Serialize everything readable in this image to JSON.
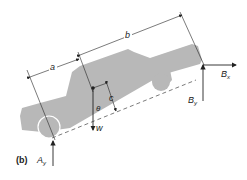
{
  "figure": {
    "label": "(b)"
  },
  "labels": {
    "a": "a",
    "b": "b",
    "c": "c",
    "theta": "θ",
    "w": "w",
    "Ax_main": "A",
    "Ay_sub": "y",
    "Bx_main": "B",
    "Bx_sub": "x",
    "By_main": "B",
    "By_sub": "y"
  },
  "colors": {
    "car": "#b8b8b8",
    "lines": "#222222"
  }
}
